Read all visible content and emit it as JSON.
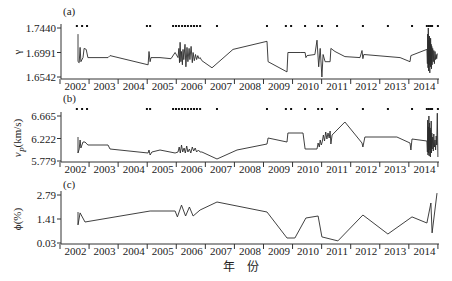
{
  "figure": {
    "xlabel": "年　份",
    "colors": {
      "line": "#2b2b2b",
      "axis": "#333333",
      "marker": "#111111"
    }
  },
  "chart_data": [
    {
      "type": "line",
      "panel": "(a)",
      "ylabel_parts": [
        [
          "γ",
          ""
        ]
      ],
      "ylim": [
        1.6542,
        1.744
      ],
      "yticks": [
        "1.7440",
        "1.6991",
        "1.6542"
      ],
      "ytick_values": [
        1.744,
        1.6991,
        1.6542
      ],
      "x_range": [
        2002,
        2015
      ],
      "xticks": [
        "2002",
        "2003",
        "2004",
        "2005",
        "2006",
        "2007",
        "2008",
        "2009",
        "2010",
        "2011",
        "2012",
        "2013",
        "2014"
      ],
      "grid": false,
      "event_markers": [
        2002.58,
        2002.76,
        2002.93,
        2004.99,
        2005.1,
        2005.89,
        2005.99,
        2006.09,
        2006.2,
        2006.3,
        2006.4,
        2006.51,
        2006.61,
        2006.71,
        2006.82,
        2007.4,
        2009.12,
        2009.77,
        2009.95,
        2010.43,
        2010.88,
        2011.01,
        2011.53,
        2012.42,
        2013.28,
        2014.11,
        2014.62,
        2014.69,
        2014.76,
        2014.8,
        2015.0
      ],
      "series": [
        {
          "name": "γ",
          "x": [
            2002.62,
            2002.62,
            2002.66,
            2002.69,
            2002.72,
            2002.79,
            2002.83,
            2002.9,
            2002.96,
            2003.65,
            2003.72,
            2005.03,
            2005.06,
            2005.1,
            2005.13,
            2005.44,
            2005.82,
            2005.96,
            2006.06,
            2006.09,
            2006.11,
            2006.13,
            2006.16,
            2006.18,
            2006.21,
            2006.23,
            2006.26,
            2006.3,
            2006.33,
            2006.37,
            2006.4,
            2006.44,
            2006.47,
            2006.51,
            2006.55,
            2006.58,
            2006.62,
            2006.66,
            2006.7,
            2006.74,
            2006.78,
            2006.82,
            2006.88,
            2007.23,
            2007.95,
            2009.12,
            2009.16,
            2009.81,
            2009.84,
            2010.26,
            2010.43,
            2010.46,
            2010.5,
            2010.77,
            2010.84,
            2010.9,
            2010.95,
            2011.01,
            2011.05,
            2011.12,
            2011.29,
            2011.32,
            2011.46,
            2011.8,
            2012.32,
            2012.39,
            2012.42,
            2012.45,
            2013.7,
            2014.04,
            2014.07,
            2014.62,
            2014.64,
            2014.65,
            2014.66,
            2014.67,
            2014.68,
            2014.69,
            2014.7,
            2014.71,
            2014.72,
            2014.73,
            2014.74,
            2014.75,
            2014.76,
            2014.77,
            2014.78,
            2014.79,
            2014.8,
            2014.82,
            2014.84,
            2014.86,
            2014.88,
            2014.9,
            2014.92,
            2014.94,
            2014.96,
            2014.98
          ],
          "y": [
            1.7328,
            1.6823,
            1.6804,
            1.7085,
            1.6823,
            1.6897,
            1.7066,
            1.7047,
            1.6897,
            1.6897,
            1.6935,
            1.6766,
            1.701,
            1.6823,
            1.6897,
            1.6897,
            1.6878,
            1.6991,
            1.6897,
            1.7066,
            1.6804,
            1.7178,
            1.6823,
            1.701,
            1.6766,
            1.7047,
            1.686,
            1.7141,
            1.6729,
            1.7085,
            1.6823,
            1.7066,
            1.686,
            1.7103,
            1.6804,
            1.6991,
            1.6841,
            1.6954,
            1.686,
            1.6935,
            1.6878,
            1.6897,
            1.6841,
            1.671,
            1.7047,
            1.7197,
            1.6823,
            1.6636,
            1.6991,
            1.6991,
            1.6991,
            1.6897,
            1.6935,
            1.6954,
            1.7216,
            1.6729,
            1.7066,
            1.6542,
            1.6954,
            1.6823,
            1.6823,
            1.7066,
            1.701,
            1.6916,
            1.6897,
            1.7028,
            1.6878,
            1.6954,
            1.6897,
            1.6823,
            1.6935,
            1.7047,
            1.6785,
            1.7328,
            1.671,
            1.744,
            1.6654,
            1.7216,
            1.6766,
            1.7291,
            1.6617,
            1.7178,
            1.6729,
            1.7253,
            1.6804,
            1.7141,
            1.6692,
            1.7103,
            1.6766,
            1.7066,
            1.6823,
            1.7028,
            1.6785,
            1.701,
            1.686,
            1.6954,
            1.6878,
            1.6972
          ]
        }
      ]
    },
    {
      "type": "line",
      "panel": "(b)",
      "ylabel_parts": [
        [
          "v",
          "italic"
        ],
        [
          "P",
          "sub"
        ],
        [
          "(km/s)",
          ""
        ]
      ],
      "ylim": [
        5.779,
        6.665
      ],
      "yticks": [
        "6.665",
        "6.222",
        "5.779"
      ],
      "ytick_values": [
        6.665,
        6.222,
        5.779
      ],
      "x_range": [
        2002,
        2015
      ],
      "xticks": [
        "2002",
        "2003",
        "2004",
        "2005",
        "2006",
        "2007",
        "2008",
        "2009",
        "2010",
        "2011",
        "2012",
        "2013",
        "2014"
      ],
      "grid": false,
      "event_markers": [
        2002.58,
        2002.76,
        2002.93,
        2004.99,
        2005.1,
        2005.89,
        2005.99,
        2006.09,
        2006.2,
        2006.3,
        2006.4,
        2006.51,
        2006.61,
        2006.71,
        2006.82,
        2007.4,
        2009.12,
        2009.77,
        2009.95,
        2010.43,
        2010.88,
        2011.01,
        2011.53,
        2012.42,
        2013.28,
        2014.11,
        2014.62,
        2014.69,
        2014.76,
        2014.8,
        2015.0
      ],
      "series": [
        {
          "name": "vP (km/s)",
          "x": [
            2002.62,
            2002.62,
            2002.66,
            2002.69,
            2002.72,
            2002.79,
            2002.86,
            2002.96,
            2003.65,
            2003.72,
            2005.03,
            2005.06,
            2005.1,
            2005.16,
            2005.44,
            2005.96,
            2006.06,
            2006.1,
            2006.14,
            2006.18,
            2006.22,
            2006.27,
            2006.31,
            2006.36,
            2006.4,
            2006.45,
            2006.5,
            2006.55,
            2006.6,
            2006.65,
            2006.7,
            2006.76,
            2006.82,
            2006.88,
            2007.4,
            2008.09,
            2009.12,
            2009.16,
            2009.81,
            2009.84,
            2010.26,
            2010.36,
            2010.43,
            2010.84,
            2010.88,
            2010.92,
            2010.95,
            2010.99,
            2011.02,
            2011.06,
            2011.1,
            2011.14,
            2011.18,
            2011.22,
            2011.26,
            2011.29,
            2011.32,
            2011.36,
            2011.8,
            2012.39,
            2012.42,
            2012.49,
            2013.59,
            2014.04,
            2014.07,
            2014.11,
            2014.62,
            2014.64,
            2014.65,
            2014.66,
            2014.67,
            2014.68,
            2014.69,
            2014.7,
            2014.71,
            2014.72,
            2014.73,
            2014.74,
            2014.75,
            2014.76,
            2014.77,
            2014.78,
            2014.79,
            2014.8,
            2014.82,
            2014.84,
            2014.86,
            2014.88,
            2014.9,
            2014.92,
            2014.94,
            2014.96,
            2014.98,
            2015.0
          ],
          "y": [
            6.252,
            5.937,
            6.015,
            6.192,
            6.035,
            6.153,
            6.153,
            6.094,
            6.094,
            6.015,
            5.937,
            5.996,
            5.897,
            5.956,
            5.996,
            5.937,
            5.956,
            6.055,
            5.937,
            6.094,
            5.956,
            6.035,
            5.937,
            6.074,
            5.956,
            6.015,
            5.937,
            6.055,
            5.976,
            6.035,
            5.956,
            5.996,
            5.956,
            5.956,
            5.818,
            5.996,
            6.114,
            6.232,
            6.153,
            6.33,
            6.33,
            6.33,
            6.015,
            6.015,
            6.133,
            6.055,
            6.192,
            6.094,
            6.153,
            6.291,
            6.173,
            6.35,
            6.212,
            6.33,
            6.232,
            6.369,
            6.114,
            6.291,
            6.547,
            6.133,
            6.055,
            6.252,
            6.252,
            6.133,
            5.996,
            6.212,
            6.173,
            5.956,
            6.585,
            5.897,
            6.45,
            5.937,
            6.665,
            5.878,
            6.527,
            5.996,
            6.43,
            5.858,
            6.389,
            6.035,
            6.567,
            5.937,
            6.33,
            6.015,
            6.252,
            5.976,
            6.31,
            6.055,
            6.192,
            5.996,
            6.271,
            6.094,
            6.72,
            5.858
          ]
        }
      ]
    },
    {
      "type": "line",
      "panel": "(c)",
      "ylabel_parts": [
        [
          "ϕ",
          ""
        ],
        [
          "(%)",
          ""
        ]
      ],
      "ylim": [
        0.03,
        2.79
      ],
      "yticks": [
        "2.79",
        "1.41",
        "0.03"
      ],
      "ytick_values": [
        2.79,
        1.41,
        0.03
      ],
      "x_range": [
        2002,
        2015
      ],
      "xticks": [
        "2002",
        "2003",
        "2004",
        "2005",
        "2006",
        "2007",
        "2008",
        "2009",
        "2010",
        "2011",
        "2012",
        "2013",
        "2014"
      ],
      "grid": false,
      "event_markers": [],
      "series": [
        {
          "name": "ϕ (%)",
          "x": [
            2002.62,
            2002.62,
            2002.69,
            2002.86,
            2005.1,
            2005.96,
            2006.04,
            2006.18,
            2006.32,
            2006.45,
            2006.58,
            2006.82,
            2007.4,
            2009.12,
            2009.81,
            2010.08,
            2010.46,
            2010.88,
            2011.01,
            2011.56,
            2012.42,
            2013.28,
            2014.11,
            2014.62,
            2014.76,
            2014.8,
            2014.97
          ],
          "y": [
            1.81,
            1.07,
            1.76,
            1.24,
            1.87,
            1.87,
            1.53,
            2.21,
            1.58,
            2.1,
            1.58,
            1.93,
            2.39,
            1.81,
            0.32,
            0.32,
            1.47,
            1.58,
            0.38,
            0.15,
            1.64,
            0.55,
            1.53,
            1.18,
            2.33,
            0.61,
            2.9
          ]
        }
      ]
    }
  ]
}
